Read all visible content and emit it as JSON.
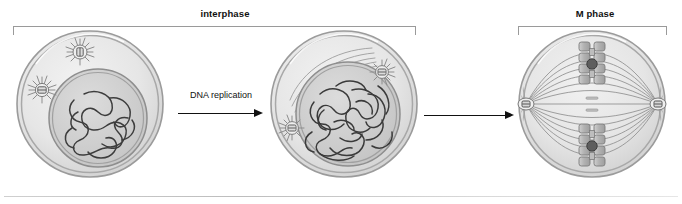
{
  "diagram": {
    "title_visible": false,
    "phases": [
      {
        "id": "interphase",
        "label": "interphase",
        "bracket": true
      },
      {
        "id": "m-phase",
        "label": "M phase",
        "bracket": true
      }
    ],
    "transitions": [
      {
        "id": "dna-replication",
        "label": "DNA replication",
        "arrow": "right"
      },
      {
        "id": "entry-to-mitosis",
        "label": "",
        "arrow": "right"
      }
    ],
    "cells": [
      {
        "id": "g1-cell",
        "stage": "G1 / early interphase",
        "nucleus": true,
        "chromatin": "decondensed, unreplicated",
        "centrosomes": 2,
        "spindle": false
      },
      {
        "id": "g2-cell",
        "stage": "G2 / late interphase",
        "nucleus": true,
        "chromatin": "decondensed, replicated (duplicated)",
        "centrosomes": 2,
        "spindle": false
      },
      {
        "id": "m-cell",
        "stage": "M phase (metaphase)",
        "nucleus": false,
        "chromatin": "condensed chromosomes at metaphase plate",
        "centrosomes": 2,
        "spindle": true,
        "chromosome_count": 4,
        "centromere_count": 2
      }
    ],
    "icons": {
      "centrosome": "centrosome-icon",
      "chromosome": "chromosome-icon",
      "centromere": "centromere-icon",
      "arrow": "arrow-right-icon"
    }
  },
  "colors": {
    "cytoplasm": "#e3e3e3",
    "membrane": "#9b9b9b",
    "nucleus_fill": "#d4d4d4",
    "nucleus_edge": "#8e8e8e",
    "chromatin": "#3b3b3b",
    "chromosome_fill": "#b9b9b9",
    "centromere": "#5a5a5a",
    "spindle": "#8a8a8a",
    "bracket": "#9a9a9a",
    "arrow": "#111111",
    "divider": "#cfcfcf",
    "text": "#111111"
  }
}
